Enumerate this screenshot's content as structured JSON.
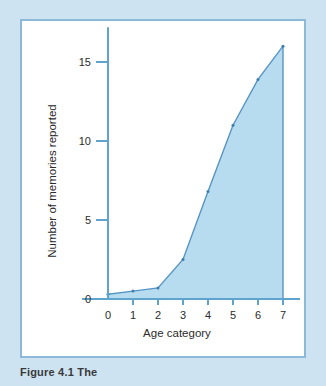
{
  "figure": {
    "caption": "Figure 4.1   The",
    "panel_background": "#ffffff",
    "page_background": "#cde3f2",
    "border_color": "#8db9d8"
  },
  "chart_data": {
    "type": "area",
    "title": "",
    "subtitle": "",
    "xlabel": "Age category",
    "ylabel": "Number of memories reported",
    "x": [
      0,
      1,
      2,
      3,
      4,
      5,
      6,
      7
    ],
    "values": [
      0.3,
      0.5,
      0.7,
      2.5,
      6.8,
      11.0,
      13.9,
      16.0
    ],
    "categories": [
      "0",
      "1",
      "2",
      "3",
      "4",
      "5",
      "6",
      "7"
    ],
    "xtick_labels": [
      "0",
      "1",
      "2",
      "3",
      "4",
      "5",
      "6",
      "7"
    ],
    "ytick_labels": [
      "0",
      "5",
      "10",
      "15"
    ],
    "yticks": [
      0,
      5,
      10,
      15
    ],
    "xlim": [
      0,
      7
    ],
    "ylim": [
      0,
      17
    ],
    "grid": false,
    "legend": false,
    "legend_position": "none",
    "line_color": "#5795c4",
    "fill_color": "#b8dcef",
    "axis_color": "#5fa3cf",
    "marker_color": "#3f7fae"
  }
}
